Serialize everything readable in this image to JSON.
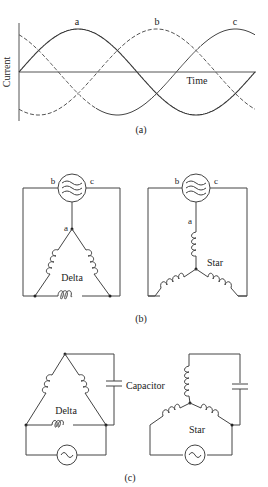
{
  "panel_a": {
    "ylabel": "Current",
    "xlabel": "Time",
    "caption": "(a)",
    "curves": [
      {
        "name": "a",
        "style": "solid",
        "phase_deg": 0
      },
      {
        "name": "b",
        "style": "dashed",
        "phase_deg": -120
      },
      {
        "name": "c",
        "style": "solid",
        "phase_deg": -240
      }
    ]
  },
  "panel_b": {
    "caption": "(b)",
    "delta": {
      "label": "Delta",
      "source_terminals": [
        "b",
        "c"
      ],
      "node_label": "a"
    },
    "star": {
      "label": "Star",
      "source_terminals": [
        "b",
        "c"
      ],
      "node_label": "a"
    }
  },
  "panel_c": {
    "caption": "(c)",
    "delta": {
      "label": "Delta"
    },
    "capacitor_label": "Capacitor",
    "star": {
      "label": "Star"
    }
  }
}
